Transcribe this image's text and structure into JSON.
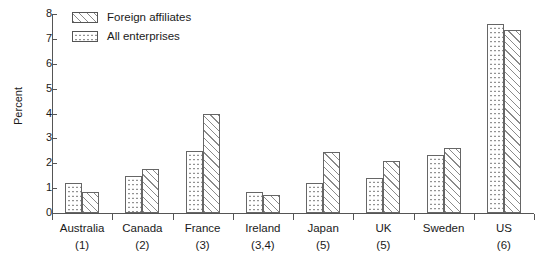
{
  "chart_data": {
    "type": "bar",
    "title": "",
    "subtitle": "",
    "xlabel": "",
    "ylabel": "Percent",
    "ylim": [
      0,
      8
    ],
    "ytick_labels": [
      "0",
      "1",
      "2",
      "3",
      "4",
      "5",
      "6",
      "7",
      "8"
    ],
    "ytick_values": [
      0,
      1,
      2,
      3,
      4,
      5,
      6,
      7,
      8
    ],
    "grid": false,
    "legend_position": "top-left",
    "categories": [
      "Australia",
      "Canada",
      "France",
      "Ireland",
      "Japan",
      "UK",
      "Sweden",
      "US"
    ],
    "category_notes": [
      "(1)",
      "(2)",
      "(3)",
      "(3,4)",
      "(5)",
      "(5)",
      "",
      "(6)"
    ],
    "series": [
      {
        "name": "All enterprises",
        "pattern": "dots",
        "values": [
          1.2,
          1.5,
          2.5,
          0.85,
          1.2,
          1.4,
          2.35,
          7.6
        ]
      },
      {
        "name": "Foreign affiliates",
        "pattern": "hatch",
        "values": [
          0.85,
          1.75,
          4.0,
          0.72,
          2.45,
          2.1,
          2.6,
          7.35
        ]
      }
    ],
    "legend": [
      {
        "label": "Foreign affiliates",
        "pattern": "hatch"
      },
      {
        "label": "All enterprises",
        "pattern": "dots"
      }
    ],
    "colors": {
      "axis": "#555555",
      "bar_border": "#666666",
      "hatch_line": "#8a8a8a",
      "dot": "#6a6a6a",
      "background": "#ffffff",
      "text": "#1a1a1a"
    }
  }
}
